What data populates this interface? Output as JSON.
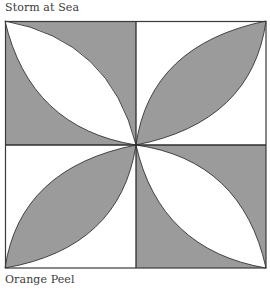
{
  "captions": {
    "top": "Storm at Sea",
    "bottom": "Orange Peel"
  },
  "quilt_block": {
    "name": "Orange Peel",
    "grid": "2x2",
    "colors": {
      "shade": "#9b9b9b",
      "light": "#ffffff",
      "line": "#333333"
    },
    "quadrants": [
      {
        "position": "top-left",
        "background": "shade",
        "lens": "light",
        "lens_diagonal": "top-left to bottom-right"
      },
      {
        "position": "top-right",
        "background": "light",
        "lens": "shade",
        "lens_diagonal": "bottom-left to top-right"
      },
      {
        "position": "bottom-left",
        "background": "light",
        "lens": "shade",
        "lens_diagonal": "bottom-left to top-right"
      },
      {
        "position": "bottom-right",
        "background": "shade",
        "lens": "light",
        "lens_diagonal": "top-left to bottom-right"
      }
    ]
  }
}
